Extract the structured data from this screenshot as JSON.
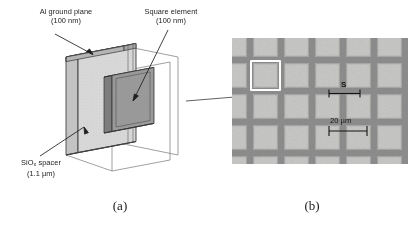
{
  "figure": {
    "type": "scientific-figure",
    "background_color": "#ffffff",
    "panels": [
      {
        "id": "a",
        "caption": "(a)",
        "kind": "3d-isometric-schematic",
        "description": "Isometric cut-away view of a layered absorber unit cell"
      },
      {
        "id": "b",
        "caption": "(b)",
        "kind": "sem-micrograph",
        "description": "Top-view micrograph of the fabricated periodic square element array"
      }
    ]
  },
  "schematic": {
    "labels": {
      "al_ground_plane": {
        "line1": "Al ground plane",
        "line2": "(100 nm)",
        "name": "al-ground-plane-label"
      },
      "square_element": {
        "line1": "Square element",
        "line2": "(100 nm)",
        "name": "square-element-label"
      },
      "siox_spacer": {
        "line1_pre": "SiO",
        "line1_sub": "x",
        "line1_post": " spacer",
        "line2": "(1.1 µm)",
        "name": "siox-spacer-label"
      }
    },
    "colors": {
      "spacer_face": "#d6d6d6",
      "spacer_top": "#dedede",
      "ground_plane": "#b4b4b4",
      "square_element": "#8f8f8f",
      "outline": "#3c3c3c",
      "wireframe": "#6e6e6e"
    },
    "materials": [
      {
        "name": "Al ground plane",
        "thickness": "100 nm"
      },
      {
        "name": "SiOx spacer",
        "thickness": "1.1 µm"
      },
      {
        "name": "Square element",
        "thickness": "100 nm"
      }
    ]
  },
  "micrograph": {
    "annotations": {
      "period_symbol": "S",
      "scale_bar": "20 µm"
    },
    "grid": {
      "columns": 6,
      "rows": 5,
      "pitch_px": 31,
      "square_px": 25,
      "highlight_col": 1,
      "highlight_row": 1
    },
    "colors": {
      "square_fill": "#c8c8c6",
      "square_edge": "#a9a9a7",
      "gap": "#8e8e8e",
      "highlight": "#fdfdfd",
      "annotation": "#131313"
    }
  },
  "captions": {
    "panel_a": "(a)",
    "panel_b": "(b)"
  }
}
